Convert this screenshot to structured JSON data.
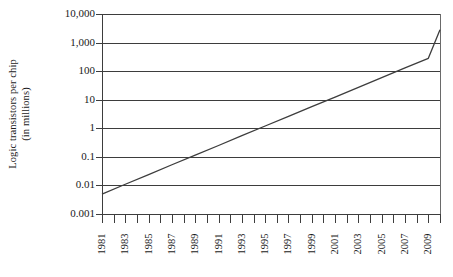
{
  "chart_data": {
    "type": "line",
    "title": "",
    "subtitle": "",
    "xlabel": "",
    "ylabel": "Logic transistors per chip (in millions)",
    "ylabel_line1": "Logic transistors per chip",
    "ylabel_line2": "(in millions)",
    "yscale": "log",
    "ylim": [
      0.001,
      10000
    ],
    "ytick_labels": [
      "10,000",
      "1,000",
      "100",
      "10",
      "1",
      "0.1",
      "0.01",
      "0.001"
    ],
    "ytick_values": [
      10000,
      1000,
      100,
      10,
      1,
      0.1,
      0.01,
      0.001
    ],
    "xlim": [
      1981,
      2010
    ],
    "xtick_labels": [
      "1981",
      "1983",
      "1985",
      "1987",
      "1989",
      "1991",
      "1993",
      "1995",
      "1997",
      "1999",
      "2001",
      "2003",
      "2005",
      "2007",
      "2009"
    ],
    "xtick_values": [
      1981,
      1983,
      1985,
      1987,
      1989,
      1991,
      1993,
      1995,
      1997,
      1999,
      2001,
      2003,
      2005,
      2007,
      2009
    ],
    "xminor_values": [
      1982,
      1984,
      1986,
      1988,
      1990,
      1992,
      1994,
      1996,
      1998,
      2000,
      2002,
      2004,
      2006,
      2008,
      2010
    ],
    "grid": "horizontal",
    "legend": "none",
    "series": [
      {
        "name": "Logic transistors per chip",
        "color": "#3d3d3d",
        "x": [
          1981,
          1983,
          1985,
          1987,
          1989,
          1991,
          1993,
          1995,
          1997,
          1999,
          2001,
          2003,
          2005,
          2007,
          2009,
          2010
        ],
        "values": [
          0.005,
          0.011,
          0.024,
          0.053,
          0.115,
          0.25,
          0.55,
          1.2,
          2.6,
          5.7,
          12.4,
          27,
          59,
          130,
          280,
          2800
        ]
      }
    ],
    "annotations": []
  },
  "caption": {
    "text": ""
  }
}
